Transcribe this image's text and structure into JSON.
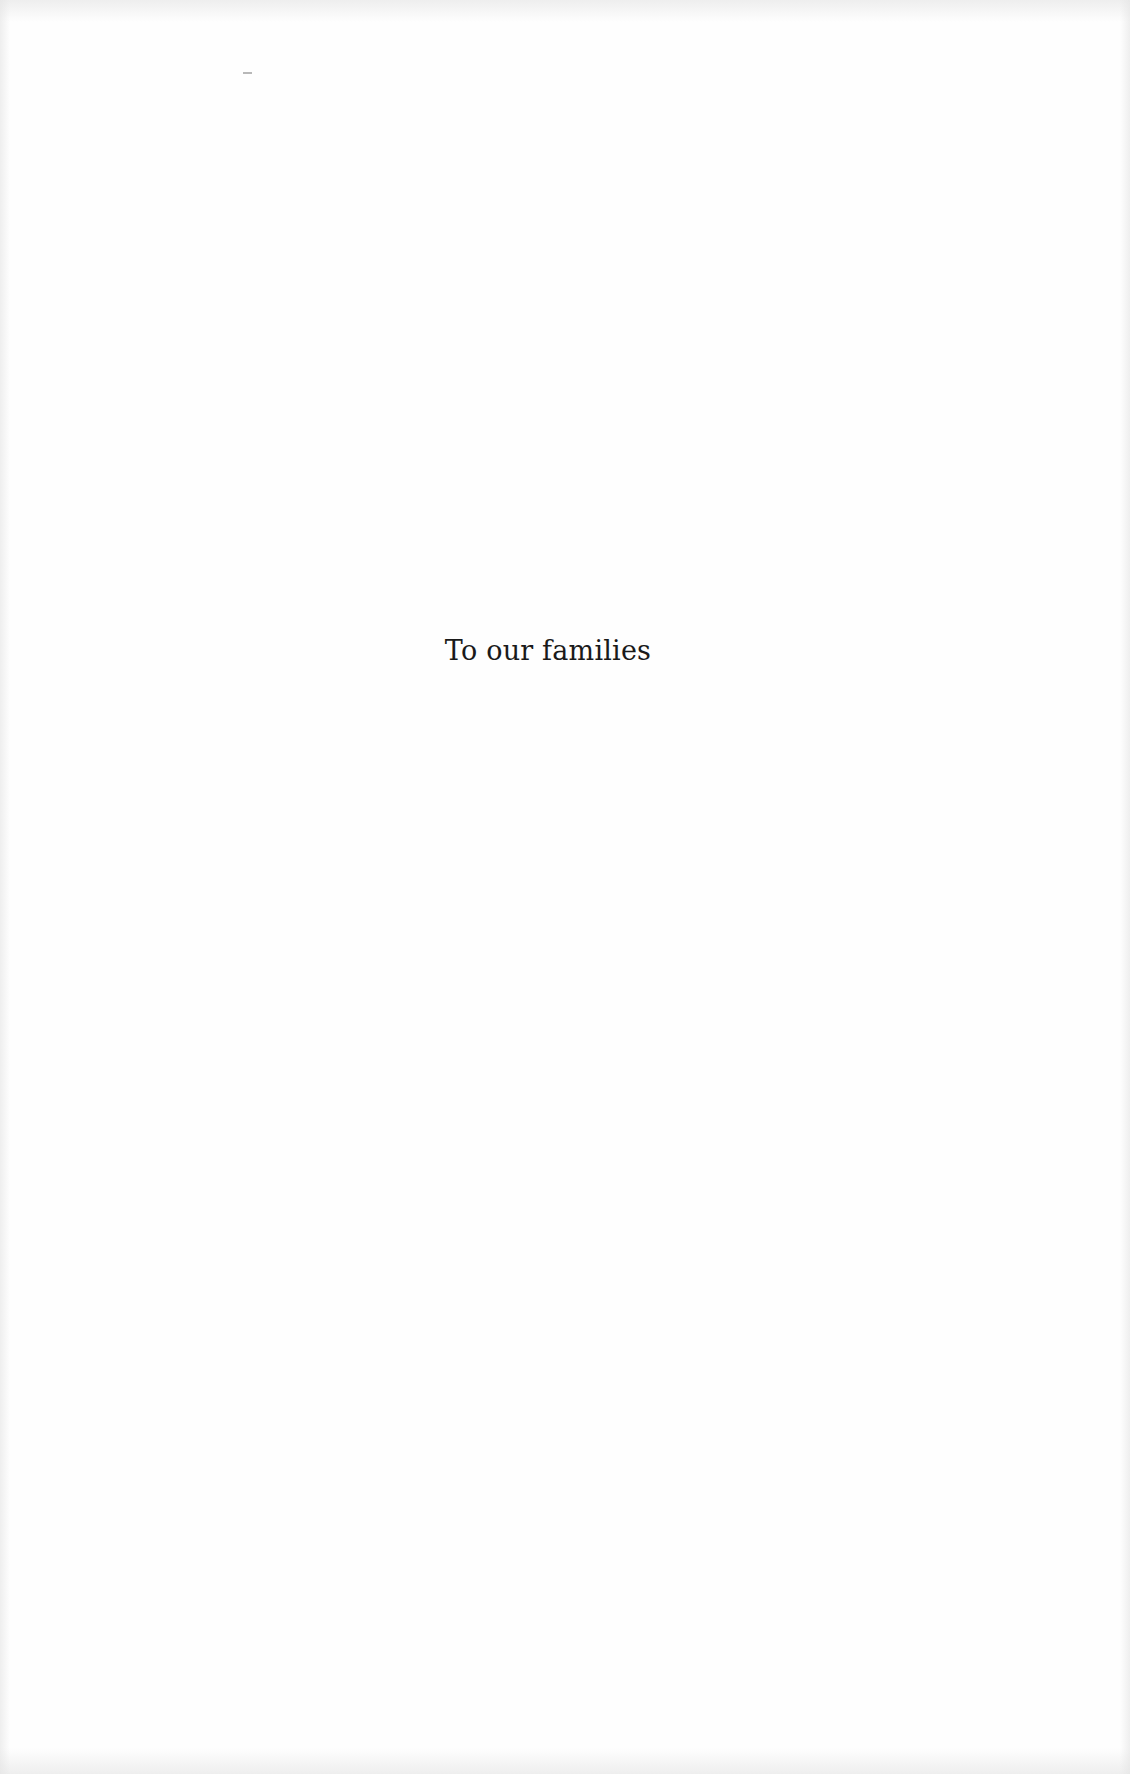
{
  "page": {
    "type": "dedication",
    "dedication_text": "To our families",
    "background_color": "#fefefe",
    "text_color": "#1a1a1a"
  }
}
